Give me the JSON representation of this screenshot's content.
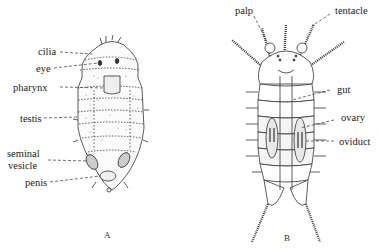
{
  "figure_a": {
    "caption": "A",
    "labels": {
      "cilia": "cilia",
      "eye": "eye",
      "pharynx": "pharynx",
      "testis": "testis",
      "seminal_vesicle_1": "seminal",
      "seminal_vesicle_2": "vesicle",
      "penis": "penis"
    }
  },
  "figure_b": {
    "caption": "B",
    "labels": {
      "palp": "palp",
      "tentacle": "tentacle",
      "gut": "gut",
      "ovary": "ovary",
      "oviduct": "oviduct"
    }
  }
}
